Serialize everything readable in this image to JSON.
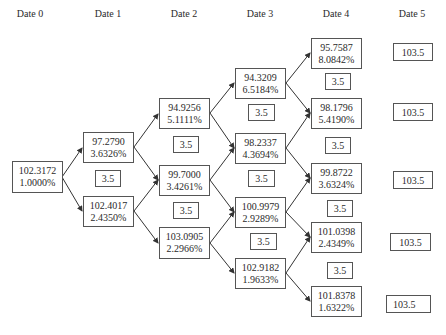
{
  "headers": [
    "Date 0",
    "Date 1",
    "Date 2",
    "Date 3",
    "Date 4",
    "Date 5"
  ],
  "nodes": {
    "d0": [
      {
        "price": "102.3172",
        "rate": "1.0000%"
      }
    ],
    "d1": [
      {
        "price": "97.2790",
        "rate": "3.6326%"
      },
      {
        "price": "102.4017",
        "rate": "2.4350%"
      }
    ],
    "d2": [
      {
        "price": "94.9256",
        "rate": "5.1111%"
      },
      {
        "price": "99.7000",
        "rate": "3.4261%"
      },
      {
        "price": "103.0905",
        "rate": "2.2966%"
      }
    ],
    "d3": [
      {
        "price": "94.3209",
        "rate": "6.5184%"
      },
      {
        "price": "98.2337",
        "rate": "4.3694%"
      },
      {
        "price": "100.9979",
        "rate": "2.9289%"
      },
      {
        "price": "102.9182",
        "rate": "1.9633%"
      }
    ],
    "d4": [
      {
        "price": "95.7587",
        "rate": "8.0842%"
      },
      {
        "price": "98.1796",
        "rate": "5.4190%"
      },
      {
        "price": "99.8722",
        "rate": "3.6324%"
      },
      {
        "price": "101.0398",
        "rate": "2.4349%"
      },
      {
        "price": "101.8378",
        "rate": "1.6322%"
      }
    ],
    "d5": [
      "103.5",
      "103.5",
      "103.5",
      "103.5",
      "103.5"
    ]
  },
  "coupon": "3.5",
  "colors": {
    "border": "#555555",
    "text": "#2a2a2a",
    "arrow": "#333333"
  }
}
